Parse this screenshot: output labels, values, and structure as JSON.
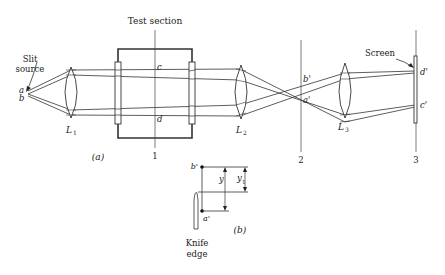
{
  "figure": {
    "part_a": {
      "caption": "(a)",
      "title": "Test section",
      "source_label_1": "Slit",
      "source_label_2": "source",
      "points": {
        "a": "a",
        "b": "b",
        "c": "c",
        "d": "d",
        "b_prime": "b'",
        "a_prime": "a'",
        "d_prime": "d'",
        "c_prime": "c'"
      },
      "lenses": {
        "L1": "L",
        "L1_sub": "1",
        "L2": "L",
        "L2_sub": "2",
        "L3": "L",
        "L3_sub": "3"
      },
      "planes": {
        "p1": "1",
        "p2": "2",
        "p3": "3"
      },
      "screen_label": "Screen"
    },
    "part_b": {
      "caption": "(b)",
      "b_prime": "b'",
      "a_prime": "a'",
      "y": "y",
      "y1": "y",
      "y1_sub": "1",
      "knife_label_1": "Knife",
      "knife_label_2": "edge"
    }
  }
}
